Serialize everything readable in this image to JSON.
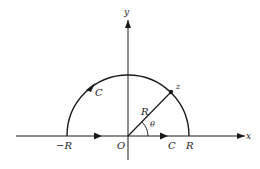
{
  "figure": {
    "axes": {
      "x_label": "x",
      "y_label": "y"
    },
    "labels": {
      "origin": "O",
      "neg_radius": "−R",
      "pos_radius": "R",
      "radius": "R",
      "point": "z",
      "angle": "θ",
      "contour_arc": "C",
      "contour_segment": "C"
    },
    "colors": {
      "ink": "#1a1a1a",
      "background": "#ffffff"
    }
  }
}
